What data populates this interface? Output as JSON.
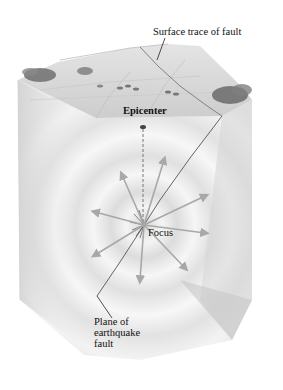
{
  "figure": {
    "type": "block-diagram"
  },
  "labels": {
    "surface_trace": "Surface trace of fault",
    "epicenter": "Epicenter",
    "focus": "Focus",
    "fault_plane_line1": "Plane of",
    "fault_plane_line2": "earthquake",
    "fault_plane_line3": "fault"
  },
  "colors": {
    "background": "#ffffff",
    "block_face": "#e6e6e6",
    "block_shade": "#cfcfcf",
    "surface": "#d9d9d9",
    "vegetation": "#6e6e6e",
    "wave_arrow": "#a8a8a8",
    "fault_line": "#555555",
    "text": "#111111"
  }
}
